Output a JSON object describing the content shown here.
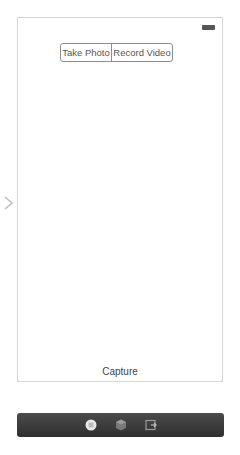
{
  "scene": {
    "segmented_control": {
      "segments": [
        "Take Photo",
        "Record Video"
      ]
    },
    "capture_label": "Capture",
    "entry_point": "chevron-right-icon",
    "status_bar": {
      "battery": "battery-icon"
    }
  },
  "dock": {
    "icons": [
      "view-controller-icon",
      "first-responder-icon",
      "exit-icon"
    ]
  },
  "colors": {
    "frame_border": "#d6d6d6",
    "dock_bg": "#3a3a3a",
    "text": "#555555"
  }
}
